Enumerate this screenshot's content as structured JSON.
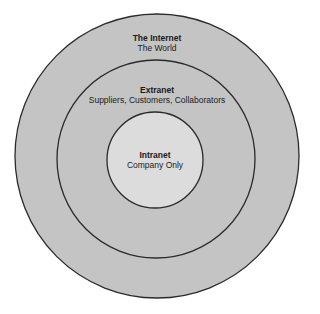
{
  "diagram": {
    "colors": {
      "background": "#ffffff",
      "ring_fill": "#c4c4c4",
      "inner_fill": "#dcdcdc",
      "stroke": "#2a2a2a"
    },
    "rings": [
      {
        "name": "internet",
        "title": "The Internet",
        "subtitle": "The World"
      },
      {
        "name": "extranet",
        "title": "Extranet",
        "subtitle": "Suppliers, Customers, Collaborators"
      },
      {
        "name": "intranet",
        "title": "Intranet",
        "subtitle": "Company Only"
      }
    ]
  }
}
